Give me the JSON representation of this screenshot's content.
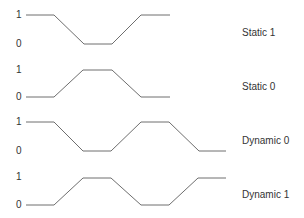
{
  "diagram": {
    "title": "",
    "line_color": "#6e6e6e",
    "text_color": "#333333",
    "waveforms": [
      {
        "name": "Static 1",
        "high_label": "1",
        "low_label": "0",
        "high_y": 15,
        "low_y": 44,
        "label_y": 33,
        "points": "26,15 54,15 84,44 112,44 141,15 170,15"
      },
      {
        "name": "Static 0",
        "high_label": "1",
        "low_label": "0",
        "high_y": 70,
        "low_y": 97,
        "label_y": 87,
        "points": "26,97 54,97 83,70 112,70 141,97 170,97"
      },
      {
        "name": "Dynamic 0",
        "high_label": "1",
        "low_label": "0",
        "high_y": 122,
        "low_y": 151,
        "label_y": 141,
        "points": "26,122 54,122 83,151 111,151 141,122 169,122 199,151 226,151"
      },
      {
        "name": "Dynamic 1",
        "high_label": "1",
        "low_label": "0",
        "high_y": 178,
        "low_y": 205,
        "label_y": 195,
        "points": "26,205 54,205 83,178 111,178 141,205 169,205 198,178 226,178"
      }
    ]
  }
}
